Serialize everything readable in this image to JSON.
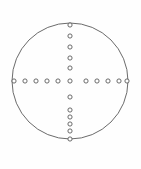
{
  "figure": {
    "title": "Reticle Dot Pattern",
    "background_color": "#fefefe",
    "width": 141,
    "height": 169
  },
  "chart_data": {
    "type": "scatter",
    "title": "Reticle Dot Pattern",
    "subtitle": "",
    "xlabel": "",
    "ylabel": "",
    "xlim": [
      0,
      141
    ],
    "ylim": [
      0,
      169
    ],
    "grid": false,
    "legend_position": "none",
    "annotations": [],
    "boundary": {
      "name": "circle-outline",
      "shape": "circle",
      "center_x": 70,
      "center_y": 81,
      "radius": 58,
      "stroke_color": "#6b6b6b",
      "stroke_width": 1,
      "fill": "none"
    },
    "marker_style": {
      "shape": "ring",
      "outer_radius": 2.1,
      "inner_radius": 1.0,
      "stroke_color": "#5a5a5a",
      "stroke_width": 0.9,
      "fill": "#ffffff"
    },
    "series": [
      {
        "name": "center-dot",
        "count": 1,
        "points": [
          {
            "x": 70,
            "y": 81
          }
        ]
      },
      {
        "name": "horizontal-left-dots",
        "count": 5,
        "points": [
          {
            "x": 14,
            "y": 81
          },
          {
            "x": 25,
            "y": 81
          },
          {
            "x": 36,
            "y": 81
          },
          {
            "x": 47,
            "y": 81
          },
          {
            "x": 58,
            "y": 81
          }
        ]
      },
      {
        "name": "horizontal-right-dots",
        "count": 5,
        "points": [
          {
            "x": 86,
            "y": 81
          },
          {
            "x": 97,
            "y": 81
          },
          {
            "x": 108,
            "y": 81
          },
          {
            "x": 119,
            "y": 81
          },
          {
            "x": 127,
            "y": 81
          }
        ]
      },
      {
        "name": "vertical-upper-dots",
        "count": 5,
        "points": [
          {
            "x": 70,
            "y": 25
          },
          {
            "x": 70,
            "y": 36
          },
          {
            "x": 70,
            "y": 47
          },
          {
            "x": 70,
            "y": 58
          },
          {
            "x": 70,
            "y": 68
          }
        ]
      },
      {
        "name": "vertical-lower-dots",
        "count": 6,
        "points": [
          {
            "x": 70,
            "y": 97
          },
          {
            "x": 70,
            "y": 110
          },
          {
            "x": 70,
            "y": 117
          },
          {
            "x": 70,
            "y": 124
          },
          {
            "x": 70,
            "y": 131
          },
          {
            "x": 70,
            "y": 139
          }
        ]
      }
    ],
    "summary": {
      "total_dots": 22,
      "horizontal_dots": 11,
      "vertical_dots": 12,
      "center_shared": 1
    }
  }
}
